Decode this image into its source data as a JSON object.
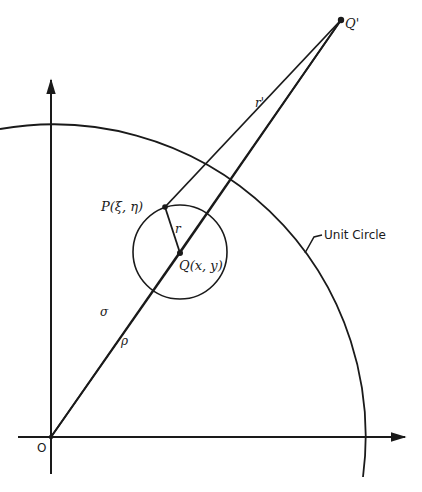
{
  "diagram": {
    "type": "geometry",
    "stroke_color": "#1a1a1a",
    "background": "#ffffff",
    "points": {
      "origin": {
        "label": "O",
        "x": 51,
        "y": 437
      },
      "P": {
        "label": "P(ξ, η)",
        "x": 165,
        "y": 207
      },
      "Q": {
        "label": "Q(x, y)",
        "x": 180,
        "y": 253
      },
      "Q_prime": {
        "label": "Q'",
        "x": 341,
        "y": 20
      }
    },
    "segments": {
      "sigma": {
        "label": "σ"
      },
      "rho": {
        "label": "ρ"
      },
      "r": {
        "label": "r"
      },
      "r_prime": {
        "label": "r'"
      }
    },
    "circles": {
      "unit_circle": {
        "label": "Unit Circle",
        "cx": 51,
        "cy": 437,
        "r": 312
      },
      "small_circle": {
        "cx": 180,
        "cy": 252,
        "r": 47
      }
    }
  }
}
